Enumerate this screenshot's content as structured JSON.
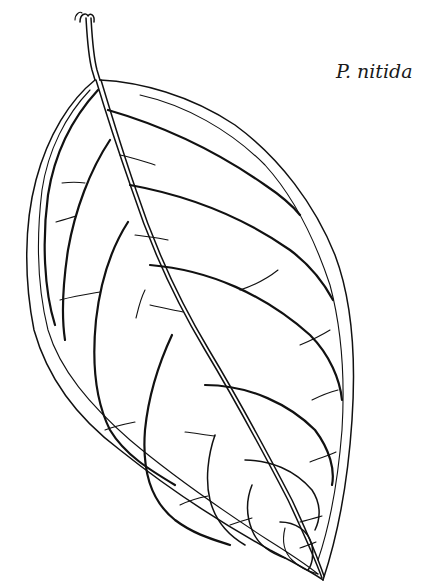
{
  "figure": {
    "caption": "P. nitida",
    "colors": {
      "ink": "#111111",
      "background": "#ffffff"
    }
  }
}
